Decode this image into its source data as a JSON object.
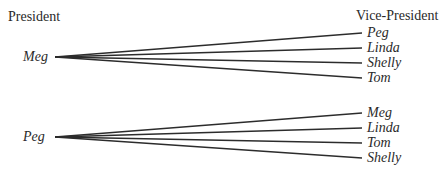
{
  "headers": {
    "left": "President",
    "right": "Vice-President"
  },
  "trees": [
    {
      "root": "Meg",
      "branches": [
        "Peg",
        "Linda",
        "Shelly",
        "Tom"
      ]
    },
    {
      "root": "Peg",
      "branches": [
        "Meg",
        "Linda",
        "Tom",
        "Shelly"
      ]
    }
  ],
  "colors": {
    "line": "#2c2c2c",
    "text": "#2a2a2a",
    "background": "#ffffff"
  }
}
